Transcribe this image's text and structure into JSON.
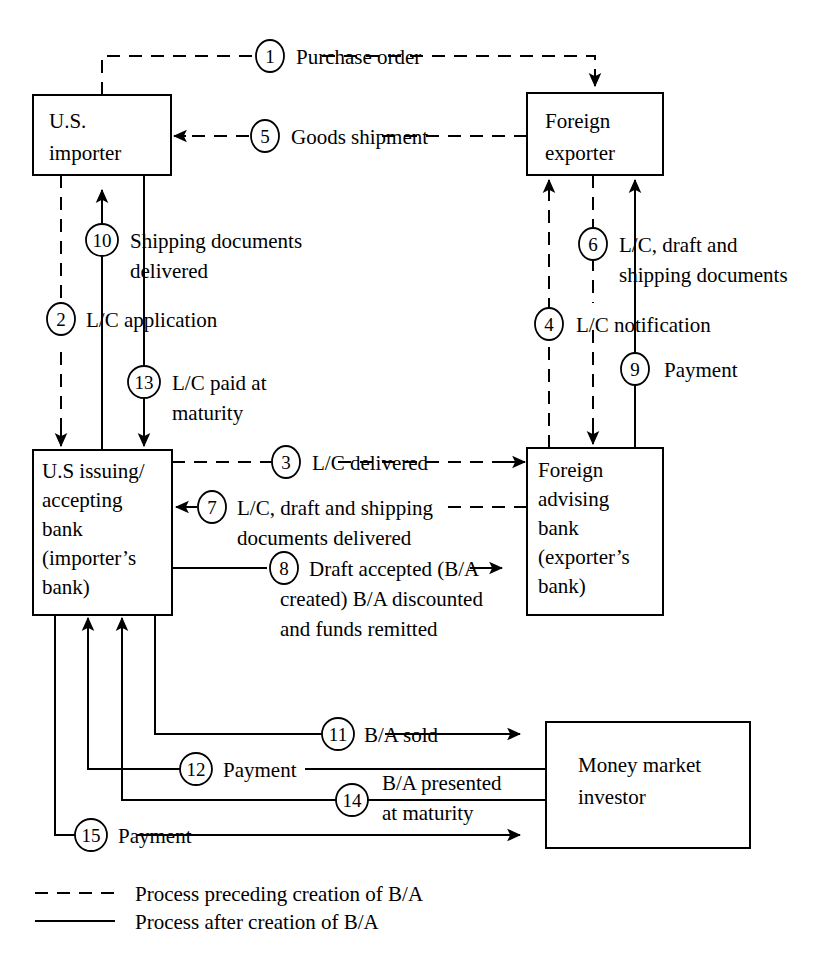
{
  "diagram": {
    "nodes": [
      {
        "id": "us-importer",
        "lines": [
          "U.S.",
          "importer"
        ]
      },
      {
        "id": "foreign-exporter",
        "lines": [
          "Foreign",
          "exporter"
        ]
      },
      {
        "id": "us-issuing-bank",
        "lines": [
          "U.S issuing/",
          "accepting",
          "bank",
          "(importer’s",
          "bank)"
        ]
      },
      {
        "id": "foreign-advising-bank",
        "lines": [
          "Foreign",
          "advising",
          "bank",
          "(exporter’s",
          "bank)"
        ]
      },
      {
        "id": "money-market-investor",
        "lines": [
          "Money market",
          "investor"
        ]
      }
    ],
    "steps": [
      {
        "n": "1",
        "lines": [
          "Purchase order"
        ],
        "style": "dashed",
        "from": "us-importer",
        "to": "foreign-exporter"
      },
      {
        "n": "2",
        "lines": [
          "L/C application"
        ],
        "style": "dashed",
        "from": "us-importer",
        "to": "us-issuing-bank"
      },
      {
        "n": "3",
        "lines": [
          "L/C delivered"
        ],
        "style": "dashed",
        "from": "us-issuing-bank",
        "to": "foreign-advising-bank"
      },
      {
        "n": "4",
        "lines": [
          "L/C notification"
        ],
        "style": "dashed",
        "from": "foreign-advising-bank",
        "to": "foreign-exporter"
      },
      {
        "n": "5",
        "lines": [
          "Goods shipment"
        ],
        "style": "dashed",
        "from": "foreign-exporter",
        "to": "us-importer"
      },
      {
        "n": "6",
        "lines": [
          "L/C, draft and",
          "shipping documents"
        ],
        "style": "dashed",
        "from": "foreign-exporter",
        "to": "foreign-advising-bank"
      },
      {
        "n": "7",
        "lines": [
          "L/C, draft and shipping",
          "documents delivered"
        ],
        "style": "dashed",
        "from": "foreign-advising-bank",
        "to": "us-issuing-bank"
      },
      {
        "n": "8",
        "lines": [
          "Draft accepted (B/A",
          "created) B/A discounted",
          "and funds remitted"
        ],
        "style": "solid",
        "from": "us-issuing-bank",
        "to": "foreign-advising-bank"
      },
      {
        "n": "9",
        "lines": [
          "Payment"
        ],
        "style": "solid",
        "from": "foreign-advising-bank",
        "to": "foreign-exporter"
      },
      {
        "n": "10",
        "lines": [
          "Shipping documents",
          "delivered"
        ],
        "style": "solid",
        "from": "us-issuing-bank",
        "to": "us-importer"
      },
      {
        "n": "11",
        "lines": [
          "B/A sold"
        ],
        "style": "solid",
        "from": "us-issuing-bank",
        "to": "money-market-investor"
      },
      {
        "n": "12",
        "lines": [
          "Payment"
        ],
        "style": "solid",
        "from": "money-market-investor",
        "to": "us-issuing-bank"
      },
      {
        "n": "13",
        "lines": [
          "L/C paid at",
          "maturity"
        ],
        "style": "solid",
        "from": "us-importer",
        "to": "us-issuing-bank"
      },
      {
        "n": "14",
        "lines": [
          "B/A presented",
          "at maturity"
        ],
        "style": "solid",
        "from": "money-market-investor",
        "to": "us-issuing-bank"
      },
      {
        "n": "15",
        "lines": [
          "Payment"
        ],
        "style": "solid",
        "from": "us-issuing-bank",
        "to": "money-market-investor"
      }
    ],
    "legend": [
      {
        "style": "dashed",
        "label": "Process preceding creation of B/A"
      },
      {
        "style": "solid",
        "label": "Process after creation of B/A"
      }
    ],
    "colors": {
      "ink": "#000000",
      "paper": "#ffffff"
    }
  }
}
